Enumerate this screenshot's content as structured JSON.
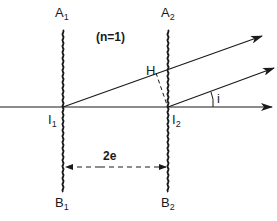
{
  "diagram": {
    "type": "optics-two-slit-plate",
    "medium_label": "(n=1)",
    "labels": {
      "A1": {
        "base": "A",
        "sub": "1"
      },
      "A2": {
        "base": "A",
        "sub": "2"
      },
      "B1": {
        "base": "B",
        "sub": "1"
      },
      "B2": {
        "base": "B",
        "sub": "2"
      },
      "I1": {
        "base": "I",
        "sub": "1"
      },
      "I2": {
        "base": "I",
        "sub": "2"
      },
      "H": "H",
      "angle": "i",
      "distance": "2e"
    },
    "colors": {
      "ink": "#1a1a1a",
      "background": "#ffffff"
    }
  }
}
